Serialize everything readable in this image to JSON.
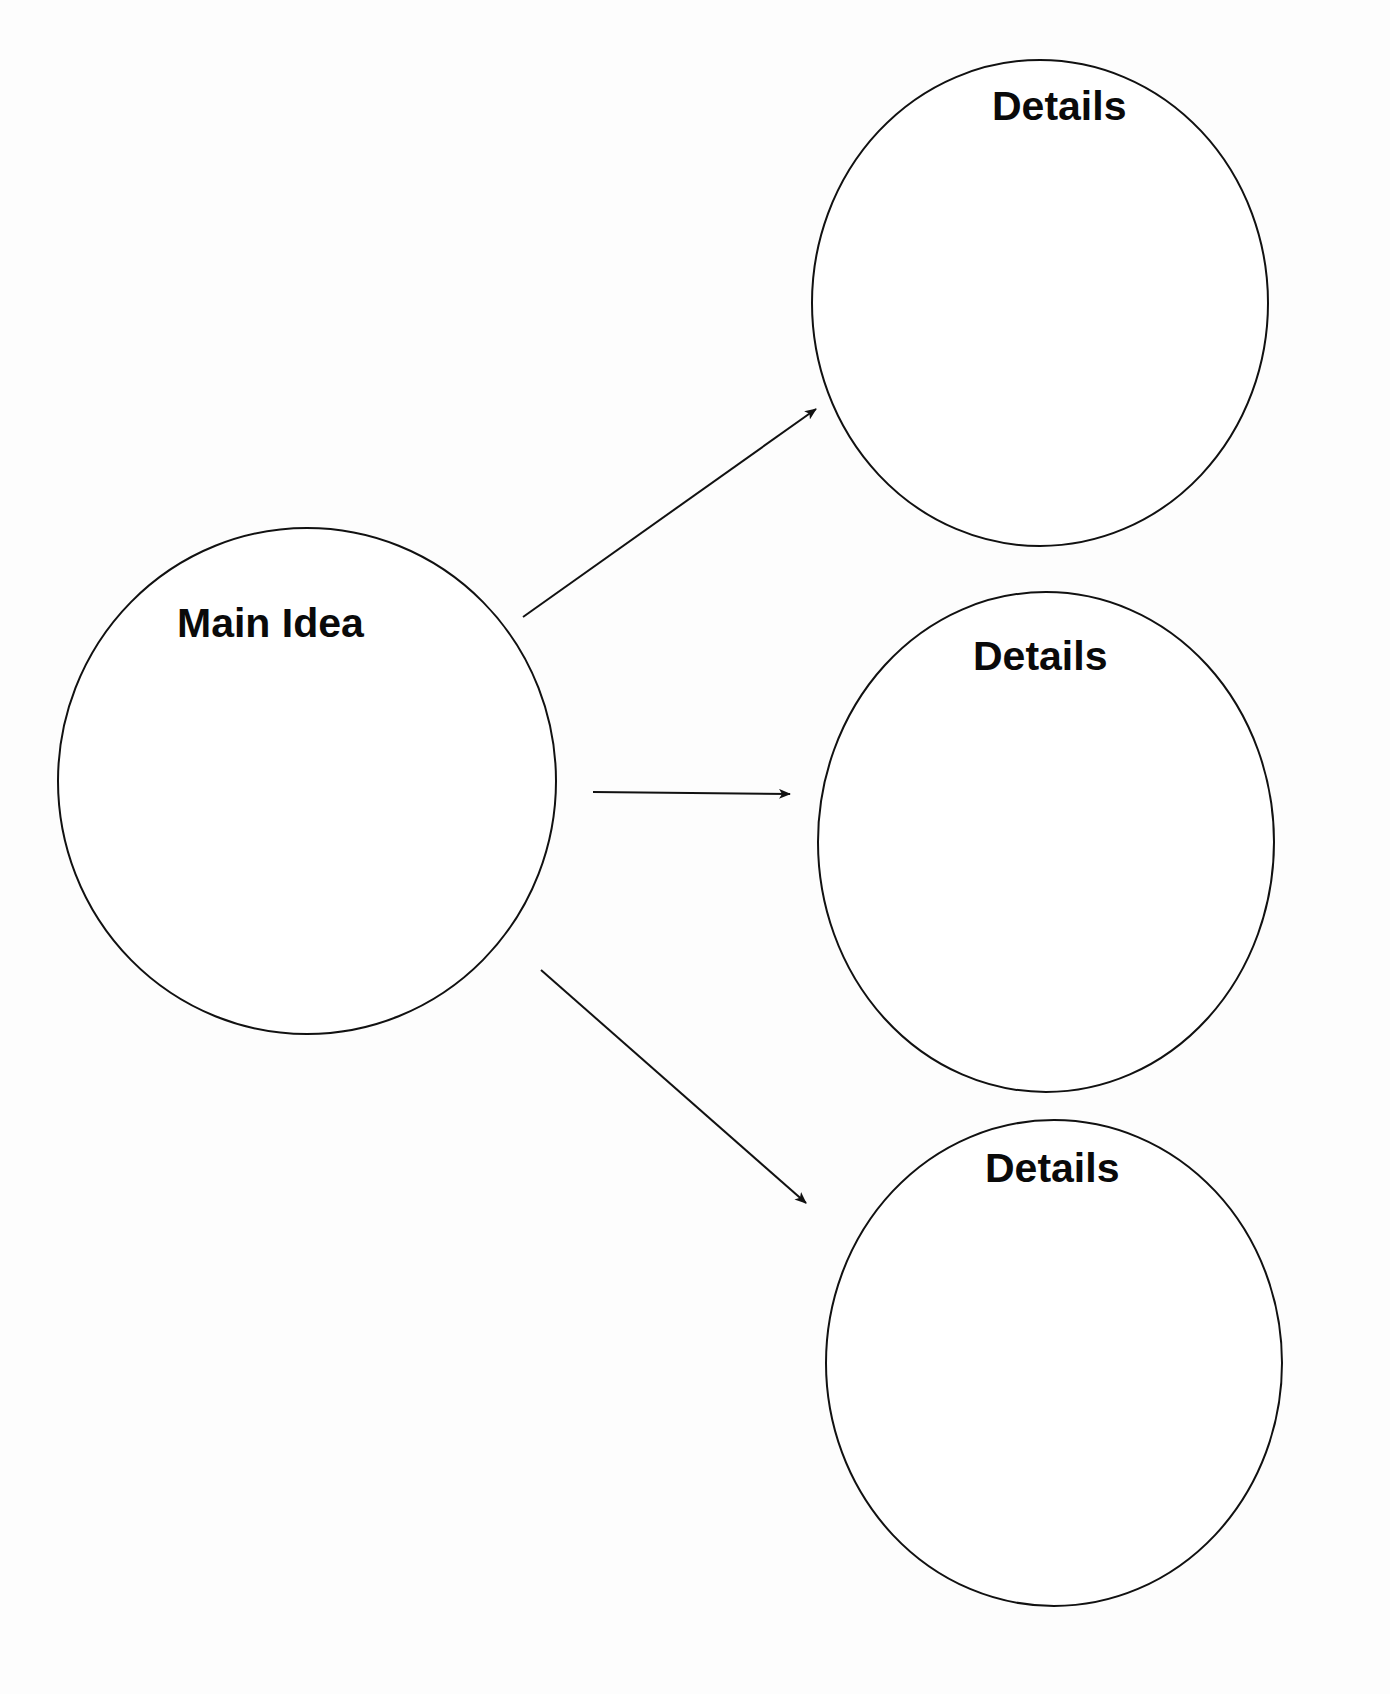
{
  "diagram": {
    "type": "main-idea-and-details graphic organizer",
    "background": "#fdfdfd",
    "stroke_color": "#111111",
    "text_color": "#0a0a0a",
    "main_node": {
      "label": "Main Idea",
      "cx": 307,
      "cy": 781,
      "rx": 249,
      "ry": 253,
      "label_x": 177,
      "label_y": 637
    },
    "detail_nodes": [
      {
        "label": "Details",
        "cx": 1040,
        "cy": 303,
        "rx": 228,
        "ry": 243,
        "label_x": 992,
        "label_y": 120
      },
      {
        "label": "Details",
        "cx": 1046,
        "cy": 842,
        "rx": 228,
        "ry": 250,
        "label_x": 973,
        "label_y": 670
      },
      {
        "label": "Details",
        "cx": 1054,
        "cy": 1363,
        "rx": 228,
        "ry": 243,
        "label_x": 985,
        "label_y": 1182
      }
    ],
    "arrows": [
      {
        "from": "main",
        "to": "details-1",
        "x1": 523,
        "y1": 617,
        "x2": 816,
        "y2": 409
      },
      {
        "from": "main",
        "to": "details-2",
        "x1": 593,
        "y1": 792,
        "x2": 790,
        "y2": 794
      },
      {
        "from": "main",
        "to": "details-3",
        "x1": 541,
        "y1": 970,
        "x2": 806,
        "y2": 1203
      }
    ]
  }
}
